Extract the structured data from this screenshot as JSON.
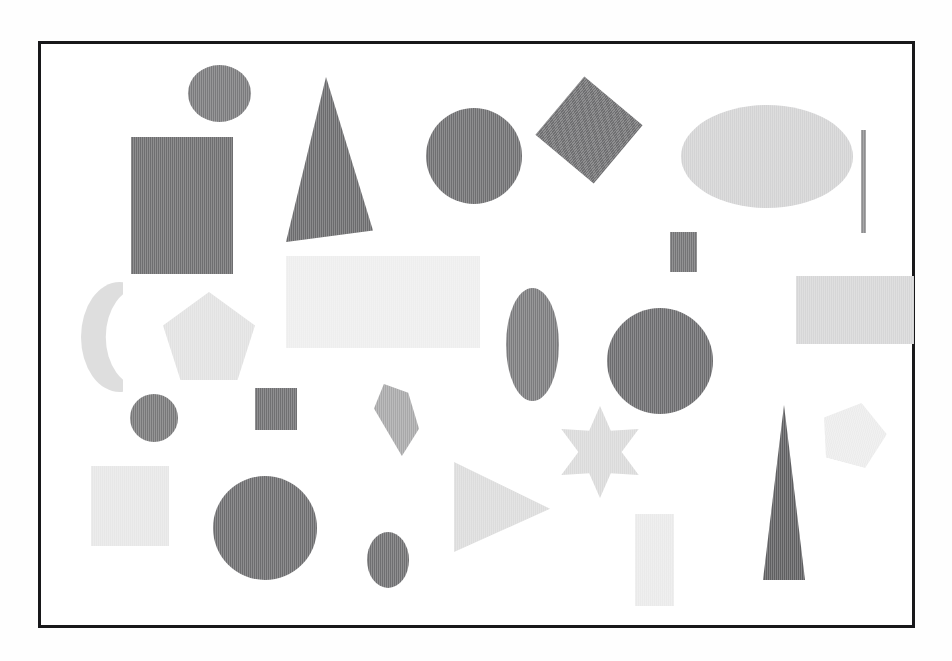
{
  "figure": {
    "caption": "",
    "frame": {
      "x": 38,
      "y": 41,
      "width": 877,
      "height": 587,
      "border_color": "#18181a",
      "border_width": 3,
      "background": "#ffffff"
    },
    "background_color": "#fefefe"
  },
  "chart_data": {
    "type": "scatter",
    "xlabel": "",
    "ylabel": "",
    "grid": false,
    "legend": "none",
    "xlim": [
      0,
      877
    ],
    "ylim": [
      0,
      587
    ],
    "note": "Positions are in pixels relative to the inner top-left of the drawn frame; fill values are scanned gray levels.",
    "categories": [
      "circle",
      "ellipse",
      "rectangle",
      "square",
      "triangle",
      "pentagon",
      "star",
      "crescent",
      "quadrilateral",
      "line"
    ],
    "counts": {
      "circle": 6,
      "ellipse": 4,
      "rectangle": 7,
      "square": 3,
      "triangle": 3,
      "pentagon": 2,
      "star": 1,
      "crescent": 1,
      "quadrilateral": 1,
      "line": 1
    },
    "total_shapes": 29,
    "shapes": [
      {
        "id": 1,
        "kind": "circle",
        "label": "dark circle small top-left",
        "x": 147,
        "y": 21,
        "w": 63,
        "h": 57,
        "fill": "#7a7a7c",
        "rotation": 0
      },
      {
        "id": 2,
        "kind": "rectangle",
        "label": "dark tall rectangle upper-left",
        "x": 90,
        "y": 93,
        "w": 102,
        "h": 137,
        "fill": "#6e6e70",
        "rotation": 0
      },
      {
        "id": 3,
        "kind": "triangle",
        "label": "dark right triangle upper",
        "x": 245,
        "y": 33,
        "w": 87,
        "h": 165,
        "fill": "#6b6b6d",
        "rotation": 0
      },
      {
        "id": 4,
        "kind": "circle",
        "label": "dark circle upper-center",
        "x": 385,
        "y": 64,
        "w": 96,
        "h": 96,
        "fill": "#6f6f71",
        "rotation": 0
      },
      {
        "id": 5,
        "kind": "square",
        "label": "dark rotated square upper",
        "x": 510,
        "y": 48,
        "w": 76,
        "h": 76,
        "fill": "#6f6f71",
        "rotation": 40
      },
      {
        "id": 6,
        "kind": "ellipse",
        "label": "light wide ellipse upper-right",
        "x": 640,
        "y": 61,
        "w": 172,
        "h": 103,
        "fill": "#d3d3d4",
        "rotation": 0
      },
      {
        "id": 7,
        "kind": "line",
        "label": "vertical line far right",
        "x": 820,
        "y": 86,
        "w": 5,
        "h": 103,
        "fill": "#8e8e90",
        "rotation": 0
      },
      {
        "id": 8,
        "kind": "rectangle",
        "label": "small dark rectangle center",
        "x": 629,
        "y": 188,
        "w": 27,
        "h": 40,
        "fill": "#747476",
        "rotation": 0
      },
      {
        "id": 9,
        "kind": "rectangle",
        "label": "large pale rectangle center",
        "x": 245,
        "y": 212,
        "w": 194,
        "h": 92,
        "fill": "#eeeeee",
        "rotation": 0
      },
      {
        "id": 10,
        "kind": "rectangle",
        "label": "light rectangle right",
        "x": 755,
        "y": 232,
        "w": 118,
        "h": 68,
        "fill": "#d6d6d7",
        "rotation": 0
      },
      {
        "id": 11,
        "kind": "crescent",
        "label": "pale crescent left",
        "x": 40,
        "y": 238,
        "w": 42,
        "h": 110,
        "fill": "#dedede",
        "rotation": 0
      },
      {
        "id": 12,
        "kind": "pentagon",
        "label": "pale pentagon left",
        "x": 122,
        "y": 248,
        "w": 92,
        "h": 88,
        "fill": "#e2e2e2",
        "rotation": 0
      },
      {
        "id": 13,
        "kind": "ellipse",
        "label": "dark tall ellipse center",
        "x": 465,
        "y": 244,
        "w": 53,
        "h": 113,
        "fill": "#7b7b7d",
        "rotation": 0
      },
      {
        "id": 14,
        "kind": "circle",
        "label": "dark circle center-right",
        "x": 566,
        "y": 264,
        "w": 106,
        "h": 106,
        "fill": "#6c6c6e",
        "rotation": 0
      },
      {
        "id": 15,
        "kind": "circle",
        "label": "dark circle small left",
        "x": 89,
        "y": 350,
        "w": 48,
        "h": 48,
        "fill": "#787879",
        "rotation": 0
      },
      {
        "id": 16,
        "kind": "square",
        "label": "dark square left-center",
        "x": 214,
        "y": 344,
        "w": 42,
        "h": 42,
        "fill": "#707072",
        "rotation": 0
      },
      {
        "id": 17,
        "kind": "quadrilateral",
        "label": "mid-gray quadrilateral",
        "x": 333,
        "y": 340,
        "w": 45,
        "h": 72,
        "fill": "#a8a8a9",
        "rotation": 0
      },
      {
        "id": 18,
        "kind": "star",
        "label": "pale six-point star",
        "x": 514,
        "y": 362,
        "w": 90,
        "h": 92,
        "fill": "#dadada",
        "rotation": 0
      },
      {
        "id": 19,
        "kind": "pentagon",
        "label": "very pale pentagon right",
        "x": 780,
        "y": 358,
        "w": 65,
        "h": 62,
        "fill": "#ececec",
        "rotation": 15
      },
      {
        "id": 20,
        "kind": "rectangle",
        "label": "pale square bottom-left",
        "x": 50,
        "y": 422,
        "w": 78,
        "h": 80,
        "fill": "#e7e7e7",
        "rotation": 0
      },
      {
        "id": 21,
        "kind": "triangle",
        "label": "pale right-pointing triangle",
        "x": 413,
        "y": 418,
        "w": 96,
        "h": 90,
        "fill": "#dcdcdc",
        "rotation": 0
      },
      {
        "id": 22,
        "kind": "circle",
        "label": "dark large circle bottom",
        "x": 172,
        "y": 432,
        "w": 104,
        "h": 104,
        "fill": "#6d6d6f",
        "rotation": 0
      },
      {
        "id": 23,
        "kind": "triangle",
        "label": "dark narrow spike right",
        "x": 722,
        "y": 361,
        "w": 42,
        "h": 175,
        "fill": "#5f5f61",
        "rotation": 0
      },
      {
        "id": 24,
        "kind": "ellipse",
        "label": "dark small ellipse bottom",
        "x": 326,
        "y": 488,
        "w": 42,
        "h": 56,
        "fill": "#6f6f71",
        "rotation": 0
      },
      {
        "id": 25,
        "kind": "rectangle",
        "label": "pale tall rectangle bottom",
        "x": 594,
        "y": 470,
        "w": 39,
        "h": 92,
        "fill": "#eaeaea",
        "rotation": 0
      }
    ],
    "fill_palette": {
      "darkest": "#5f5f61",
      "dark": "#6d6d6f",
      "medium": "#7b7b7d",
      "mid_light": "#a8a8a9",
      "light": "#d3d3d4",
      "lighter": "#e2e2e2",
      "lightest": "#eeeeee"
    }
  }
}
